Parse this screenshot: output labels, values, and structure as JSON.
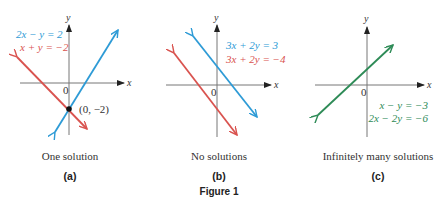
{
  "colors": {
    "blue": "#2e9bd6",
    "red": "#d9534f",
    "green": "#2e8b57",
    "axis": "#555555"
  },
  "figure_title": "Figure 1",
  "panels": [
    {
      "id": "a",
      "label": "(a)",
      "caption": "One solution",
      "x_label": "x",
      "y_label": "y",
      "origin_label": "0",
      "equations": [
        {
          "text": "2x − y = 2",
          "color": "blue"
        },
        {
          "text": "x + y = −2",
          "color": "red"
        }
      ],
      "point_label": "(0, −2)"
    },
    {
      "id": "b",
      "label": "(b)",
      "caption": "No solutions",
      "x_label": "x",
      "y_label": "y",
      "origin_label": "0",
      "equations": [
        {
          "text": "3x + 2y = 3",
          "color": "blue"
        },
        {
          "text": "3x + 2y = −4",
          "color": "red"
        }
      ]
    },
    {
      "id": "c",
      "label": "(c)",
      "caption": "Infinitely many solutions",
      "x_label": "x",
      "y_label": "y",
      "origin_label": "0",
      "equations": [
        {
          "text": "x − y = −3",
          "color": "green"
        },
        {
          "text": "2x − 2y = −6",
          "color": "green"
        }
      ]
    }
  ]
}
